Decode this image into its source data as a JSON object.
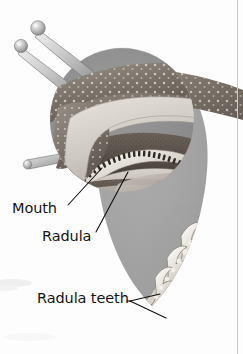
{
  "figure": {
    "style": "grayscale scientific illustration",
    "width": 243,
    "height": 354
  },
  "labels": {
    "mouth": "Mouth",
    "radula": "Radula",
    "radula_teeth": "Radula teeth"
  },
  "icons": {
    "leader_mouth": "leader-line-icon",
    "leader_radula": "leader-line-icon",
    "leader_teeth": "branching-leader-line-icon"
  },
  "colors": {
    "background": "#fdfdfd",
    "circle_inset": "#8e8e8e",
    "teardrop_callout": "#a5a5a5",
    "label_text": "#141414",
    "leader_line": "#111111",
    "tissue_dark": "#4a4543",
    "tissue_mid": "#8a8078",
    "tissue_light": "#d7d2cb",
    "tooth_highlight": "#f2efe9",
    "rule": "#c9c9c9"
  },
  "parts": {
    "tentacles": "two eye stalks with bulbous tips",
    "lower_tentacle": "short sensory tentacle",
    "speckled_skin": "mottled snail mantle",
    "tooth_count_visible": 6
  }
}
